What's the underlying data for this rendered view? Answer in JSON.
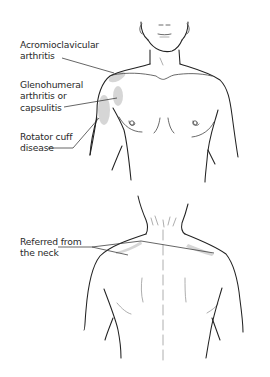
{
  "diagram": {
    "front_view": {
      "labels": {
        "acromioclavicular": "Acromioclavicular\narthritis",
        "glenohumeral": "Glenohumeral\narthritis or\ncapsulitis",
        "rotator_cuff": "Rotator cuff\ndisease"
      }
    },
    "back_view": {
      "labels": {
        "referred": "Referred from\nthe neck"
      }
    },
    "colors": {
      "line": "#222222",
      "pain_area": "#cfcfcf",
      "text": "#2a2a2a",
      "background": "#ffffff"
    }
  }
}
